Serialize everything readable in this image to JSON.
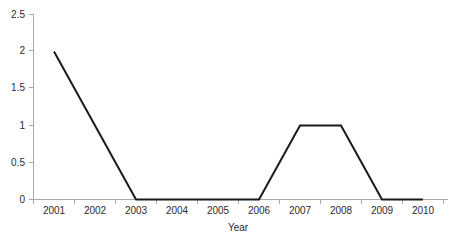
{
  "chart_data": {
    "type": "line",
    "title": "",
    "xlabel": "Year",
    "ylabel": "",
    "categories": [
      "2001",
      "2002",
      "2003",
      "2004",
      "2005",
      "2006",
      "2007",
      "2008",
      "2009",
      "2010"
    ],
    "values": [
      2,
      1,
      0,
      0,
      0,
      0,
      1,
      1,
      0,
      0
    ],
    "series": [
      {
        "name": "series-1",
        "values": [
          2,
          1,
          0,
          0,
          0,
          0,
          1,
          1,
          0,
          0
        ],
        "color": "#1a1a1a",
        "marker": "none"
      }
    ],
    "ylim": [
      0,
      2.5
    ],
    "y_ticks": [
      "0",
      "0.5",
      "1",
      "1.5",
      "2",
      "2.5"
    ],
    "y_tick_values": [
      0,
      0.5,
      1,
      1.5,
      2,
      2.5
    ],
    "x_ticks": [
      "2001",
      "2002",
      "2003",
      "2004",
      "2005",
      "2006",
      "2007",
      "2008",
      "2009",
      "2010"
    ],
    "grid": false,
    "legend": "none",
    "axis_color": "#a8a8a8",
    "background": "#ffffff",
    "text_color": "#2b2b2b"
  }
}
